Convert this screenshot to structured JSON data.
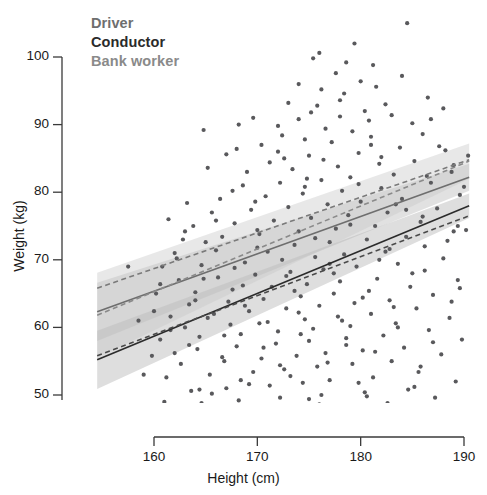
{
  "figure": {
    "width": 487,
    "height": 495,
    "background": "#ffffff"
  },
  "legend": {
    "position": "top-left-inside",
    "items": [
      {
        "label": "Driver",
        "color": "#6e6e6e",
        "line_style": "solid",
        "name": "legend-driver"
      },
      {
        "label": "Conductor",
        "color": "#2b2b2b",
        "line_style": "solid",
        "name": "legend-conductor"
      },
      {
        "label": "Bank worker",
        "color": "#8a8a8a",
        "line_style": "dashed",
        "name": "legend-bank"
      }
    ]
  },
  "axes": {
    "x": {
      "label": "Height (cm)",
      "ticks": [
        160,
        170,
        180,
        190
      ],
      "tick_labels": [
        "160",
        "170",
        "180",
        "190"
      ],
      "range": [
        154.5,
        190.5
      ]
    },
    "y": {
      "label": "Weight (kg)",
      "ticks": [
        50,
        60,
        70,
        80,
        90,
        100
      ],
      "tick_labels": [
        "50",
        "60",
        "70",
        "80",
        "90",
        "100"
      ],
      "range": [
        44.5,
        106.5
      ]
    },
    "grid": "off",
    "frame": "L-shaped (left and bottom spines only)"
  },
  "chart_data": {
    "type": "scatter",
    "title": "",
    "subtitle": "",
    "xlabel": "Height (cm)",
    "ylabel": "Weight (kg)",
    "xlim": [
      154.5,
      190.5
    ],
    "ylim": [
      44.5,
      106.5
    ],
    "xticks": [
      160,
      170,
      180,
      190
    ],
    "yticks": [
      50,
      60,
      70,
      80,
      90,
      100
    ],
    "grid": false,
    "legend_position": "upper left",
    "point_color": "#59595c",
    "point_size_px": 4.2,
    "annotations": [],
    "series": [
      {
        "name": "Driver",
        "color": "#6e6e6e",
        "line_style": "solid",
        "fit_line": {
          "x": [
            154.5,
            190.5
          ],
          "y": [
            62.3,
            82.2
          ],
          "slope": 0.553,
          "intercept": -23.2
        },
        "confidence_band": {
          "x": [
            154.5,
            190.5
          ],
          "lower": [
            58.0,
            80.2
          ],
          "upper": [
            66.6,
            84.2
          ]
        },
        "band_color": "#bdbdbd",
        "band_opacity": 0.45
      },
      {
        "name": "Conductor",
        "color": "#2b2b2b",
        "line_style": "solid",
        "fit_line": {
          "x": [
            154.5,
            190.5
          ],
          "y": [
            55.2,
            78.0
          ],
          "slope": 0.633,
          "intercept": -42.7
        },
        "confidence_band": {
          "x": [
            154.5,
            190.5
          ],
          "lower": [
            50.9,
            76.2
          ],
          "upper": [
            59.5,
            79.8
          ]
        },
        "band_color": "#b0b0b0",
        "band_opacity": 0.42
      },
      {
        "name": "Bank worker",
        "color": "#8a8a8a",
        "line_style": "dashed",
        "fit_line": {
          "x": [
            154.5,
            190.5
          ],
          "y": [
            61.8,
            84.6
          ],
          "slope": 0.633,
          "intercept": -36.1
        },
        "confidence_band": {
          "x": [
            154.5,
            190.5
          ],
          "lower": [
            55.5,
            82.0
          ],
          "upper": [
            68.1,
            87.2
          ]
        },
        "band_color": "#c6c6c6",
        "band_opacity": 0.4
      },
      {
        "name": "Conductor lower dashed",
        "color": "#4a4a4a",
        "line_style": "dashed",
        "fit_line": {
          "x": [
            154.5,
            190.5
          ],
          "y": [
            55.8,
            76.5
          ],
          "slope": 0.575,
          "intercept": -33.1
        },
        "confidence_band": null
      },
      {
        "name": "Driver upper dashed",
        "color": "#7a7a7a",
        "line_style": "dashed",
        "fit_line": {
          "x": [
            154.5,
            190.5
          ],
          "y": [
            65.8,
            84.8
          ],
          "slope": 0.528,
          "intercept": -15.8
        },
        "confidence_band": null
      }
    ],
    "points": [
      [
        184.5,
        105.0
      ],
      [
        176.0,
        100.6
      ],
      [
        178.6,
        99.2
      ],
      [
        181.2,
        98.8
      ],
      [
        174.0,
        96.0
      ],
      [
        181.5,
        95.6
      ],
      [
        186.5,
        94.0
      ],
      [
        178.0,
        93.6
      ],
      [
        175.8,
        92.8
      ],
      [
        180.4,
        92.0
      ],
      [
        183.0,
        91.4
      ],
      [
        168.2,
        90.0
      ],
      [
        172.0,
        89.8
      ],
      [
        176.6,
        89.4
      ],
      [
        179.2,
        89.0
      ],
      [
        164.8,
        89.2
      ],
      [
        186.0,
        88.6
      ],
      [
        181.0,
        88.2
      ],
      [
        174.6,
        87.8
      ],
      [
        177.2,
        87.4
      ],
      [
        170.4,
        87.0
      ],
      [
        183.8,
        86.6
      ],
      [
        188.2,
        86.2
      ],
      [
        179.8,
        85.8
      ],
      [
        175.0,
        85.4
      ],
      [
        172.6,
        85.0
      ],
      [
        167.0,
        85.6
      ],
      [
        185.2,
        84.6
      ],
      [
        181.8,
        84.2
      ],
      [
        177.8,
        83.8
      ],
      [
        173.4,
        83.4
      ],
      [
        169.0,
        83.0
      ],
      [
        165.2,
        83.6
      ],
      [
        188.8,
        83.0
      ],
      [
        183.2,
        82.6
      ],
      [
        179.0,
        82.2
      ],
      [
        176.2,
        81.8
      ],
      [
        172.2,
        81.4
      ],
      [
        168.6,
        81.0
      ],
      [
        186.8,
        81.4
      ],
      [
        182.0,
        80.6
      ],
      [
        178.2,
        80.2
      ],
      [
        174.4,
        79.8
      ],
      [
        170.8,
        79.4
      ],
      [
        166.4,
        79.0
      ],
      [
        189.6,
        79.6
      ],
      [
        184.0,
        79.0
      ],
      [
        180.0,
        78.6
      ],
      [
        176.8,
        78.2
      ],
      [
        173.0,
        77.8
      ],
      [
        169.4,
        77.4
      ],
      [
        165.6,
        77.0
      ],
      [
        187.4,
        77.6
      ],
      [
        182.6,
        77.0
      ],
      [
        178.8,
        76.6
      ],
      [
        175.2,
        76.2
      ],
      [
        171.6,
        75.8
      ],
      [
        167.8,
        75.4
      ],
      [
        163.8,
        75.0
      ],
      [
        185.8,
        75.6
      ],
      [
        181.4,
        75.0
      ],
      [
        177.6,
        74.6
      ],
      [
        174.0,
        74.2
      ],
      [
        170.2,
        73.8
      ],
      [
        166.6,
        73.4
      ],
      [
        162.8,
        73.0
      ],
      [
        189.0,
        74.2
      ],
      [
        184.4,
        73.4
      ],
      [
        180.6,
        73.0
      ],
      [
        177.0,
        72.6
      ],
      [
        173.6,
        72.2
      ],
      [
        170.0,
        71.8
      ],
      [
        166.0,
        71.4
      ],
      [
        162.0,
        71.0
      ],
      [
        186.2,
        72.0
      ],
      [
        182.4,
        71.2
      ],
      [
        178.4,
        70.8
      ],
      [
        175.6,
        70.4
      ],
      [
        172.4,
        70.0
      ],
      [
        168.8,
        69.6
      ],
      [
        164.6,
        69.2
      ],
      [
        160.8,
        69.0
      ],
      [
        188.0,
        70.2
      ],
      [
        183.6,
        69.4
      ],
      [
        179.6,
        69.0
      ],
      [
        176.4,
        68.6
      ],
      [
        173.2,
        68.2
      ],
      [
        169.8,
        67.8
      ],
      [
        166.2,
        67.4
      ],
      [
        162.4,
        67.0
      ],
      [
        185.0,
        68.0
      ],
      [
        181.6,
        67.2
      ],
      [
        178.0,
        66.8
      ],
      [
        174.8,
        66.4
      ],
      [
        171.4,
        66.0
      ],
      [
        167.6,
        65.6
      ],
      [
        164.0,
        65.2
      ],
      [
        160.2,
        65.0
      ],
      [
        189.4,
        67.0
      ],
      [
        184.8,
        66.0
      ],
      [
        180.8,
        65.4
      ],
      [
        177.4,
        65.0
      ],
      [
        174.2,
        64.6
      ],
      [
        170.6,
        64.2
      ],
      [
        167.2,
        63.8
      ],
      [
        163.4,
        63.4
      ],
      [
        187.0,
        64.8
      ],
      [
        182.8,
        64.0
      ],
      [
        179.4,
        63.6
      ],
      [
        176.0,
        63.2
      ],
      [
        172.8,
        62.8
      ],
      [
        169.2,
        62.4
      ],
      [
        165.8,
        62.0
      ],
      [
        161.6,
        61.6
      ],
      [
        185.4,
        62.8
      ],
      [
        181.0,
        62.0
      ],
      [
        177.8,
        61.6
      ],
      [
        174.6,
        61.2
      ],
      [
        171.0,
        60.8
      ],
      [
        167.4,
        60.4
      ],
      [
        163.0,
        60.0
      ],
      [
        188.6,
        61.4
      ],
      [
        183.4,
        60.6
      ],
      [
        179.0,
        60.2
      ],
      [
        175.4,
        59.8
      ],
      [
        172.0,
        59.4
      ],
      [
        168.4,
        59.0
      ],
      [
        164.4,
        58.6
      ],
      [
        160.6,
        58.2
      ],
      [
        186.6,
        59.6
      ],
      [
        182.2,
        58.8
      ],
      [
        178.6,
        58.4
      ],
      [
        175.0,
        58.0
      ],
      [
        171.8,
        57.6
      ],
      [
        168.0,
        57.2
      ],
      [
        164.2,
        56.8
      ],
      [
        189.8,
        58.2
      ],
      [
        184.2,
        57.0
      ],
      [
        180.2,
        56.6
      ],
      [
        176.6,
        56.2
      ],
      [
        173.8,
        55.8
      ],
      [
        170.4,
        55.4
      ],
      [
        166.8,
        55.0
      ],
      [
        162.6,
        54.6
      ],
      [
        187.8,
        56.0
      ],
      [
        183.0,
        55.0
      ],
      [
        179.2,
        54.6
      ],
      [
        175.8,
        54.2
      ],
      [
        172.6,
        53.8
      ],
      [
        169.6,
        53.4
      ],
      [
        165.4,
        53.0
      ],
      [
        161.2,
        52.6
      ],
      [
        185.6,
        53.4
      ],
      [
        181.2,
        52.6
      ],
      [
        177.0,
        52.2
      ],
      [
        174.4,
        51.8
      ],
      [
        171.2,
        51.4
      ],
      [
        167.0,
        51.0
      ],
      [
        163.6,
        50.6
      ],
      [
        189.2,
        52.0
      ],
      [
        184.6,
        50.8
      ],
      [
        180.4,
        50.4
      ],
      [
        176.2,
        50.0
      ],
      [
        172.2,
        49.6
      ],
      [
        168.2,
        49.2
      ],
      [
        164.6,
        48.8
      ],
      [
        160.4,
        48.4
      ],
      [
        187.2,
        49.6
      ],
      [
        182.6,
        48.8
      ],
      [
        178.8,
        48.4
      ],
      [
        175.6,
        48.0
      ],
      [
        173.4,
        47.6
      ],
      [
        169.0,
        47.2
      ],
      [
        165.0,
        46.8
      ],
      [
        161.8,
        46.4
      ],
      [
        166.2,
        46.0
      ],
      [
        170.8,
        46.6
      ],
      [
        177.2,
        46.2
      ],
      [
        183.8,
        47.0
      ],
      [
        188.4,
        47.4
      ],
      [
        179.6,
        47.8
      ],
      [
        174.0,
        90.8
      ],
      [
        180.8,
        90.6
      ],
      [
        185.0,
        90.2
      ],
      [
        171.2,
        84.4
      ],
      [
        176.4,
        84.8
      ],
      [
        182.0,
        85.2
      ],
      [
        186.4,
        82.4
      ],
      [
        167.6,
        80.2
      ],
      [
        163.2,
        78.4
      ],
      [
        161.4,
        76.0
      ],
      [
        189.0,
        84.0
      ],
      [
        187.6,
        86.8
      ],
      [
        175.2,
        91.8
      ],
      [
        178.4,
        94.6
      ],
      [
        173.0,
        93.2
      ],
      [
        169.6,
        91.0
      ],
      [
        184.0,
        97.2
      ],
      [
        177.6,
        97.6
      ],
      [
        180.0,
        96.4
      ],
      [
        172.4,
        88.4
      ],
      [
        168.0,
        86.4
      ],
      [
        174.8,
        82.0
      ],
      [
        179.8,
        81.2
      ],
      [
        183.4,
        78.2
      ],
      [
        186.0,
        76.4
      ],
      [
        170.0,
        74.4
      ],
      [
        165.0,
        72.6
      ],
      [
        162.2,
        70.2
      ],
      [
        188.4,
        72.8
      ],
      [
        181.8,
        70.0
      ],
      [
        177.0,
        69.4
      ],
      [
        172.8,
        67.6
      ],
      [
        168.6,
        66.2
      ],
      [
        164.0,
        64.0
      ],
      [
        160.0,
        62.4
      ],
      [
        189.6,
        65.8
      ],
      [
        183.2,
        63.0
      ],
      [
        178.2,
        61.0
      ],
      [
        174.2,
        59.0
      ],
      [
        170.6,
        57.0
      ],
      [
        166.6,
        55.6
      ],
      [
        162.0,
        56.2
      ],
      [
        187.0,
        57.8
      ],
      [
        181.4,
        56.4
      ],
      [
        176.8,
        54.8
      ],
      [
        173.2,
        52.8
      ],
      [
        169.2,
        51.6
      ],
      [
        165.6,
        50.2
      ],
      [
        161.0,
        49.0
      ],
      [
        185.2,
        51.2
      ],
      [
        180.6,
        49.8
      ],
      [
        176.0,
        48.6
      ],
      [
        171.6,
        47.4
      ],
      [
        167.2,
        46.6
      ],
      [
        175.4,
        99.8
      ],
      [
        179.4,
        102.0
      ],
      [
        182.4,
        93.0
      ],
      [
        176.2,
        95.2
      ],
      [
        172.0,
        86.0
      ],
      [
        186.8,
        90.8
      ],
      [
        188.0,
        92.4
      ],
      [
        178.0,
        91.2
      ],
      [
        181.0,
        87.0
      ],
      [
        174.6,
        80.8
      ],
      [
        169.8,
        78.6
      ],
      [
        166.0,
        75.8
      ],
      [
        163.0,
        74.2
      ],
      [
        190.0,
        80.8
      ],
      [
        184.4,
        77.4
      ],
      [
        179.0,
        75.2
      ],
      [
        175.6,
        73.2
      ],
      [
        171.0,
        71.2
      ],
      [
        167.8,
        68.8
      ],
      [
        164.8,
        67.2
      ],
      [
        160.6,
        66.4
      ],
      [
        189.4,
        75.0
      ],
      [
        182.8,
        71.6
      ],
      [
        177.4,
        68.0
      ],
      [
        173.6,
        65.4
      ],
      [
        168.8,
        63.2
      ],
      [
        165.2,
        61.4
      ],
      [
        161.6,
        59.6
      ],
      [
        186.2,
        68.4
      ],
      [
        180.2,
        64.4
      ],
      [
        174.0,
        62.2
      ],
      [
        170.2,
        60.6
      ],
      [
        166.8,
        58.8
      ],
      [
        163.4,
        57.4
      ],
      [
        159.8,
        55.8
      ],
      [
        188.8,
        63.8
      ],
      [
        183.6,
        60.0
      ],
      [
        178.6,
        57.4
      ],
      [
        172.2,
        54.4
      ],
      [
        168.4,
        52.2
      ],
      [
        164.4,
        50.8
      ],
      [
        160.8,
        47.8
      ],
      [
        185.8,
        54.2
      ],
      [
        179.8,
        51.8
      ],
      [
        175.0,
        49.4
      ],
      [
        170.4,
        48.0
      ],
      [
        166.4,
        47.2
      ],
      [
        162.6,
        48.2
      ],
      [
        187.4,
        48.0
      ],
      [
        184.8,
        45.8
      ],
      [
        157.5,
        69.0
      ],
      [
        158.5,
        61.0
      ],
      [
        159.0,
        53.0
      ],
      [
        190.2,
        74.4
      ],
      [
        190.4,
        85.4
      ]
    ]
  }
}
